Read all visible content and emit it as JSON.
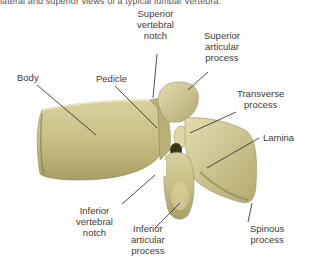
{
  "caption": "lateral and superior views of a typical lumbar vertebra.",
  "figure": {
    "bone_color": "#c9c08a",
    "bone_shadow": "#8c8450",
    "line_color": "#222222"
  },
  "labels": {
    "superior_vertebral_notch": {
      "line1": "Superior",
      "line2": "vertebral",
      "line3": "notch"
    },
    "superior_articular_process": {
      "line1": "Superior",
      "line2": "articular",
      "line3": "process"
    },
    "body": {
      "line1": "Body"
    },
    "pedicle": {
      "line1": "Pedicle"
    },
    "transverse_process": {
      "line1": "Transverse",
      "line2": "process"
    },
    "lamina": {
      "line1": "Lamina"
    },
    "inferior_vertebral_notch": {
      "line1": "Inferior",
      "line2": "vertebral",
      "line3": "notch"
    },
    "inferior_articular_process": {
      "line1": "Inferior",
      "line2": "articular",
      "line3": "process"
    },
    "spinous_process": {
      "line1": "Spinous",
      "line2": "process"
    }
  }
}
